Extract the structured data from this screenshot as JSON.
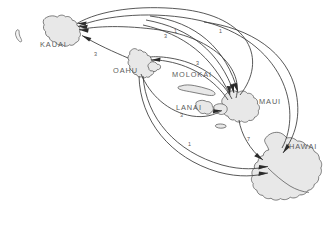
{
  "map": {
    "title": "Hawaiian Islands inter-island route map",
    "background_color": "#ffffff",
    "island_fill_color": "#e8e8e8",
    "island_stroke_color": "#4a4a4a",
    "route_color": "#3a3a3a",
    "label_color": "#5d5d5d",
    "islands": [
      {
        "id": "niihau",
        "label": "",
        "label_x": 0,
        "label_y": 0
      },
      {
        "id": "kauai",
        "label": "KAUAI",
        "label_x": 40,
        "label_y": 47
      },
      {
        "id": "oahu",
        "label": "OAHU",
        "label_x": 113,
        "label_y": 73
      },
      {
        "id": "molokai",
        "label": "MOLOKAI",
        "label_x": 191,
        "label_y": 77
      },
      {
        "id": "lanai",
        "label": "LANAI",
        "label_x": 189,
        "label_y": 110
      },
      {
        "id": "maui",
        "label": "MAUI",
        "label_x": 259,
        "label_y": 104
      },
      {
        "id": "hawaii",
        "label": "HAWAI",
        "label_x": 289,
        "label_y": 147
      }
    ],
    "routes": [
      {
        "id": "maui-kauai-outer",
        "from": "MAUI",
        "to": "KAUAI",
        "count": "1",
        "count_x": 219,
        "count_y": 33
      },
      {
        "id": "hawaii-kauai-outer",
        "from": "HAWAI",
        "to": "KAUAI",
        "count": "1",
        "count_x": 174,
        "count_y": 33
      },
      {
        "id": "oahu-kauai",
        "from": "OAHU",
        "to": "KAUAI",
        "count": "3",
        "count_x": 94,
        "count_y": 56
      },
      {
        "id": "maui-kauai-inner",
        "from": "MAUI",
        "to": "KAUAI",
        "count": "3",
        "count_x": 164,
        "count_y": 38
      },
      {
        "id": "maui-oahu-upper",
        "from": "MAUI",
        "to": "OAHU",
        "count": "3",
        "count_x": 196,
        "count_y": 65
      },
      {
        "id": "oahu-maui-lower",
        "from": "OAHU",
        "to": "MAUI",
        "count": "3",
        "count_x": 180,
        "count_y": 117
      },
      {
        "id": "oahu-hawaii",
        "from": "OAHU",
        "to": "HAWAI",
        "count": "1",
        "count_x": 188,
        "count_y": 146
      },
      {
        "id": "maui-hawaii",
        "from": "MAUI",
        "to": "HAWAI",
        "count": "7",
        "count_x": 247,
        "count_y": 141
      }
    ]
  }
}
